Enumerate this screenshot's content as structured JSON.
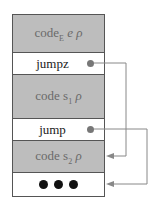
{
  "diagram": {
    "rows": [
      {
        "label": "code",
        "sub": "E",
        "rest": " e ρ",
        "style": "gray"
      },
      {
        "label": "jumpz",
        "style": "white",
        "has_pointer": true
      },
      {
        "label": "code s",
        "sub": "1",
        "rest": " ρ",
        "style": "gray"
      },
      {
        "label": "jump",
        "style": "white",
        "has_pointer": true
      },
      {
        "label": "code s",
        "sub": "2",
        "rest": " ρ",
        "style": "gray"
      },
      {
        "label": "•••",
        "style": "white"
      }
    ],
    "arrows": [
      {
        "from": "jumpz",
        "to": "code s2 ρ"
      },
      {
        "from": "jump",
        "to": "•••"
      }
    ],
    "colors": {
      "gray": "#bdbdbd",
      "border": "#555555",
      "arrow": "#888888"
    }
  }
}
